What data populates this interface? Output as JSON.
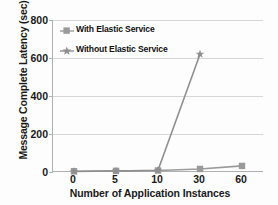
{
  "chart_data": {
    "type": "line",
    "title": "",
    "xlabel": "Number of Application Instances",
    "ylabel": "Message Complete Latency (sec)",
    "categories": [
      "0",
      "5",
      "10",
      "30",
      "60"
    ],
    "ytick_labels": [
      "0",
      "200",
      "400",
      "600",
      "800"
    ],
    "ylim": [
      0,
      800
    ],
    "ytick_step": 200,
    "grid": true,
    "legend_position": "upper-left-inside",
    "series": [
      {
        "name": "With Elastic Service",
        "marker": "square",
        "color": "#9a9a9a",
        "values": [
          4,
          6,
          8,
          16,
          32
        ]
      },
      {
        "name": "Without Elastic Service",
        "marker": "star",
        "color": "#8f8f8f",
        "values": [
          3,
          5,
          9,
          620,
          null
        ]
      }
    ]
  },
  "axis": {
    "line_color": "#b0b0b0",
    "grid_color": "#d6d6d6",
    "text_color": "#1a1a1a"
  },
  "legend": {
    "entries": [
      {
        "label": "With Elastic Service",
        "marker": "square-marker",
        "color": "#9a9a9a"
      },
      {
        "label": "Without Elastic Service",
        "marker": "star-marker",
        "color": "#8f8f8f"
      }
    ]
  }
}
